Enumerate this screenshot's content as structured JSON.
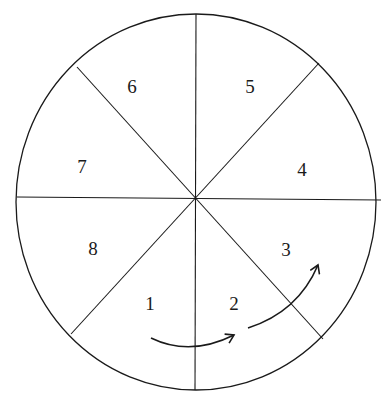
{
  "diagram": {
    "type": "circle divided into 8 numbered sectors",
    "sectors": [
      {
        "label": "1",
        "x": 150,
        "y": 310
      },
      {
        "label": "2",
        "x": 234,
        "y": 310
      },
      {
        "label": "3",
        "x": 286,
        "y": 256
      },
      {
        "label": "4",
        "x": 302,
        "y": 176
      },
      {
        "label": "5",
        "x": 250,
        "y": 93
      },
      {
        "label": "6",
        "x": 132,
        "y": 93
      },
      {
        "label": "7",
        "x": 82,
        "y": 173
      },
      {
        "label": "8",
        "x": 93,
        "y": 255
      }
    ],
    "arrows": [
      {
        "name": "arrow-1-to-2",
        "description": "curved arrow from sector 1 to sector 2"
      },
      {
        "name": "arrow-2-to-3",
        "description": "curved arrow from sector 2 to sector 3"
      }
    ],
    "colors": {
      "stroke": "#1a1a1a",
      "background": "#ffffff"
    }
  }
}
